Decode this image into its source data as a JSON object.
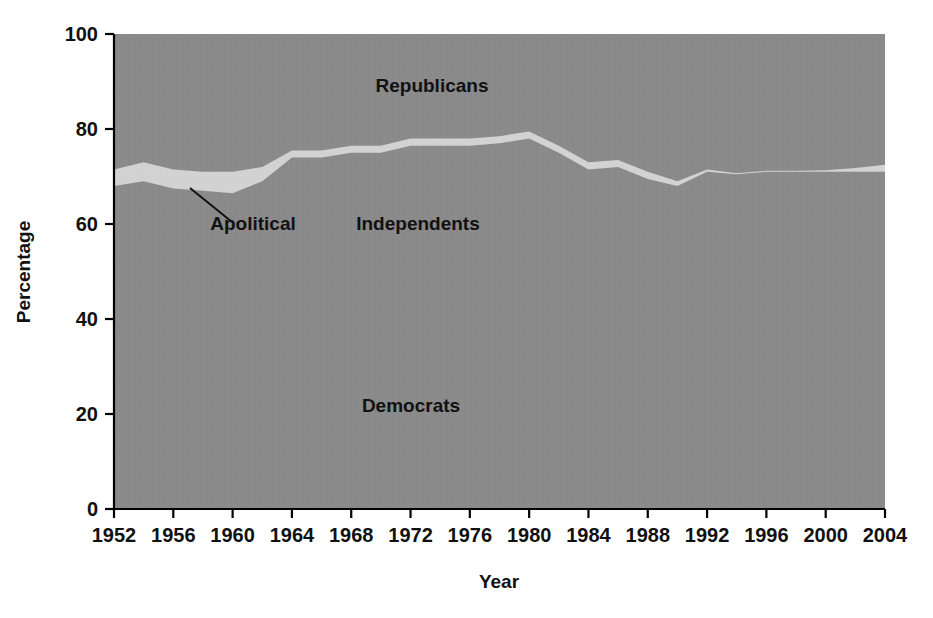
{
  "chart_data": {
    "type": "area",
    "title": "",
    "subtitle": "",
    "xlabel": "Year",
    "ylabel": "Percentage",
    "xlim": [
      1952,
      2004
    ],
    "ylim": [
      0,
      100
    ],
    "grid": false,
    "legend_position": "inline-annotations",
    "stacked": true,
    "stack_order_bottom_to_top": [
      "Democrats",
      "Independents",
      "Apolitical",
      "Republicans"
    ],
    "x": [
      1952,
      1954,
      1956,
      1958,
      1960,
      1962,
      1964,
      1966,
      1968,
      1970,
      1972,
      1974,
      1976,
      1978,
      1980,
      1982,
      1984,
      1986,
      1988,
      1990,
      1992,
      1994,
      1996,
      1998,
      2000,
      2002,
      2004
    ],
    "xticks": [
      1952,
      1956,
      1960,
      1964,
      1968,
      1972,
      1976,
      1980,
      1984,
      1988,
      1992,
      1996,
      2000,
      2004
    ],
    "xticklabels": [
      "1952",
      "1956",
      "1960",
      "1964",
      "1968",
      "1972",
      "1976",
      "1980",
      "1984",
      "1988",
      "1992",
      "1996",
      "2000",
      "2004"
    ],
    "yticks": [
      0,
      20,
      40,
      60,
      80,
      100
    ],
    "yticklabels": [
      "0",
      "20",
      "40",
      "60",
      "80",
      "100"
    ],
    "series": [
      {
        "name": "Democrats",
        "color": "#8a8a8a",
        "values": [
          47.0,
          47.0,
          45.5,
          48.0,
          46.0,
          46.5,
          52.0,
          46.0,
          45.0,
          44.0,
          41.5,
          39.0,
          40.0,
          39.0,
          41.5,
          44.0,
          37.0,
          39.0,
          35.5,
          35.0,
          35.0,
          34.0,
          39.0,
          34.0,
          34.5,
          33.0,
          33.0
        ]
      },
      {
        "name": "Independents",
        "color": "#8a8a8a",
        "values": [
          21.0,
          22.0,
          22.0,
          19.0,
          20.5,
          22.5,
          22.0,
          28.0,
          30.0,
          31.0,
          35.0,
          37.5,
          36.5,
          38.0,
          36.5,
          31.0,
          34.5,
          33.0,
          34.0,
          33.0,
          36.0,
          36.5,
          32.0,
          37.0,
          36.5,
          38.0,
          38.0
        ]
      },
      {
        "name": "Apolitical",
        "color": "#d2d2d2",
        "values": [
          3.5,
          4.0,
          4.0,
          4.0,
          4.5,
          3.0,
          1.5,
          1.5,
          1.5,
          1.5,
          1.5,
          1.5,
          1.5,
          1.5,
          1.5,
          1.5,
          1.5,
          1.5,
          1.5,
          1.0,
          0.5,
          0.2,
          0.2,
          0.2,
          0.3,
          0.8,
          1.5
        ]
      },
      {
        "name": "Republicans",
        "color": "#8a8a8a",
        "values": [
          28.5,
          27.0,
          28.5,
          29.0,
          29.0,
          28.0,
          24.5,
          24.5,
          23.5,
          23.5,
          22.0,
          22.0,
          22.0,
          21.5,
          20.5,
          23.5,
          27.0,
          26.5,
          29.0,
          31.0,
          28.5,
          29.3,
          28.8,
          28.8,
          28.7,
          28.2,
          27.5
        ]
      }
    ],
    "cumulative_boundaries": {
      "note": "Upper edge of each stacked band in percent, bottom-to-top",
      "democrats_top": [
        47.0,
        47.0,
        45.5,
        48.0,
        46.0,
        46.5,
        52.0,
        46.0,
        45.0,
        44.0,
        41.5,
        39.0,
        40.0,
        39.0,
        41.5,
        44.0,
        37.0,
        39.0,
        35.5,
        35.0,
        35.0,
        34.0,
        39.0,
        34.0,
        34.5,
        33.0,
        33.0
      ],
      "independents_top": [
        68.0,
        69.0,
        67.5,
        67.0,
        66.5,
        69.0,
        74.0,
        74.0,
        75.0,
        75.0,
        76.5,
        76.5,
        76.5,
        77.0,
        78.0,
        75.0,
        71.5,
        72.0,
        69.5,
        68.0,
        71.0,
        70.5,
        71.0,
        71.0,
        71.0,
        71.0,
        71.0
      ],
      "apolitical_top": [
        71.5,
        73.0,
        71.5,
        71.0,
        71.0,
        72.0,
        75.5,
        75.5,
        76.5,
        76.5,
        78.0,
        78.0,
        78.0,
        78.5,
        79.5,
        76.5,
        73.0,
        73.5,
        71.0,
        69.0,
        71.5,
        70.7,
        71.2,
        71.2,
        71.3,
        71.8,
        72.5
      ],
      "republicans_top": [
        100,
        100,
        100,
        100,
        100,
        100,
        100,
        100,
        100,
        100,
        100,
        100,
        100,
        100,
        100,
        100,
        100,
        100,
        100,
        100,
        100,
        100,
        100,
        100,
        100,
        100,
        100
      ]
    },
    "annotations": [
      {
        "name": "republicans-label",
        "text": "Republicans",
        "x_px": 432,
        "y_px": 92
      },
      {
        "name": "apolitical-label",
        "text": "Apolitical",
        "x_px": 253,
        "y_px": 230
      },
      {
        "name": "independents-label",
        "text": "Independents",
        "x_px": 418,
        "y_px": 230
      },
      {
        "name": "democrats-label",
        "text": "Democrats",
        "x_px": 411,
        "y_px": 412
      }
    ],
    "colors": {
      "plot_fill": "#8a8a8a",
      "apolitical_fill": "#d2d2d2",
      "axis": "#000000",
      "text": "#111111",
      "background": "#ffffff"
    }
  }
}
